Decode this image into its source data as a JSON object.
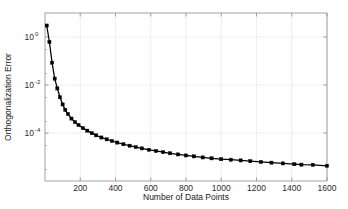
{
  "chart_data": {
    "type": "line",
    "title": "",
    "xlabel": "Number of Data Points",
    "ylabel": "Orthogonalization Error",
    "xscale": "linear",
    "yscale": "log",
    "xlim": [
      0,
      1600
    ],
    "ylim": [
      1e-06,
      10
    ],
    "grid": true,
    "legend": null,
    "marker": "square",
    "line_color": "#000000",
    "marker_color": "#000000",
    "xticks": [
      200,
      400,
      600,
      800,
      1000,
      1200,
      1400,
      1600
    ],
    "xticklabels": [
      "200",
      "400",
      "600",
      "800",
      "1000",
      "1200",
      "1400",
      "1600"
    ],
    "yticks": [
      1,
      0.01,
      0.0001
    ],
    "yticklabels": [
      "10^0",
      "10^-2",
      "10^-4"
    ],
    "ytick_mantissa": [
      "10",
      "10",
      "10"
    ],
    "ytick_exponents": [
      "0",
      "-2",
      "-4"
    ],
    "series": [
      {
        "name": "Orthogonalization Error",
        "x": [
          10,
          25,
          40,
          55,
          70,
          85,
          100,
          115,
          130,
          150,
          170,
          190,
          215,
          240,
          265,
          290,
          320,
          350,
          380,
          410,
          445,
          480,
          515,
          550,
          590,
          630,
          670,
          710,
          755,
          800,
          845,
          895,
          945,
          1000,
          1055,
          1110,
          1165,
          1225,
          1285,
          1350,
          1415,
          1455,
          1520,
          1600
        ],
        "y": [
          3.0,
          0.62,
          0.085,
          0.0185,
          0.0072,
          0.0031,
          0.00155,
          0.00092,
          0.00062,
          0.0004,
          0.000285,
          0.000215,
          0.00016,
          0.000125,
          9.85e-05,
          8e-05,
          6.5e-05,
          5.45e-05,
          4.65e-05,
          4e-05,
          3.4e-05,
          2.95e-05,
          2.58e-05,
          2.28e-05,
          2e-05,
          1.78e-05,
          1.59e-05,
          1.43e-05,
          1.28e-05,
          1.16e-05,
          1.06e-05,
          9.6e-06,
          8.8e-06,
          8.1e-06,
          7.7e-06,
          7.2e-06,
          6.7e-06,
          6.2e-06,
          5.8e-06,
          5.4e-06,
          5e-06,
          4.8e-06,
          4.7e-06,
          4.3e-06
        ]
      }
    ]
  },
  "axes": {
    "box_color": "#8c8c8c",
    "grid_color": "#e6e6e6",
    "background": "#ffffff"
  }
}
